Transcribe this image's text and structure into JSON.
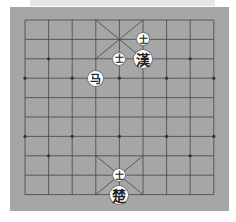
{
  "banner": {
    "text": "— — — —"
  },
  "board": {
    "background": "#a6a6a6",
    "line_color": "#444444",
    "columns": 9,
    "rows": 10,
    "grid_origin": [
      25,
      20
    ],
    "col_gap": 23.6,
    "row_gap": 19.4
  },
  "pieces": [
    {
      "id": "han-advisor-1",
      "glyph": "士",
      "side": "han",
      "type": "advisor",
      "col": 5,
      "row": 1,
      "size": "small"
    },
    {
      "id": "han-advisor-2",
      "glyph": "士",
      "side": "han",
      "type": "advisor",
      "col": 4,
      "row": 2,
      "size": "small"
    },
    {
      "id": "han-general",
      "glyph": "漢",
      "side": "han",
      "type": "general",
      "col": 5,
      "row": 2,
      "size": "large"
    },
    {
      "id": "horse",
      "glyph": "马",
      "side": "han",
      "type": "horse",
      "col": 3,
      "row": 3,
      "size": "mid"
    },
    {
      "id": "cho-advisor",
      "glyph": "士",
      "side": "cho",
      "type": "advisor",
      "col": 4,
      "row": 8,
      "size": "small"
    },
    {
      "id": "cho-general",
      "glyph": "楚",
      "side": "cho",
      "type": "general",
      "col": 4,
      "row": 9,
      "size": "large"
    }
  ]
}
